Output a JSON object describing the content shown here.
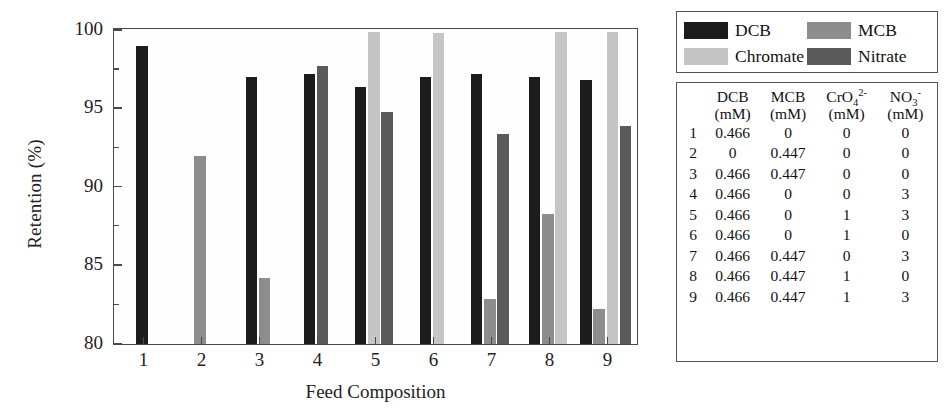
{
  "chart_data": {
    "type": "bar",
    "title": "",
    "xlabel": "Feed Composition",
    "ylabel": "Retention (%)",
    "ylim": [
      80,
      100
    ],
    "yticks": [
      80,
      85,
      90,
      95,
      100
    ],
    "yticks_minor": [
      82.5,
      87.5,
      92.5,
      97.5
    ],
    "grid": false,
    "legend_position": "outside-top-right",
    "categories": [
      "1",
      "2",
      "3",
      "4",
      "5",
      "6",
      "7",
      "8",
      "9"
    ],
    "series": [
      {
        "name": "DCB",
        "color": "#1c1c1c",
        "values": [
          99.0,
          null,
          97.0,
          97.2,
          96.4,
          97.0,
          97.2,
          97.0,
          96.8
        ]
      },
      {
        "name": "MCB",
        "color": "#8d8d8d",
        "values": [
          null,
          92.0,
          84.2,
          null,
          null,
          null,
          82.9,
          88.3,
          82.2
        ]
      },
      {
        "name": "Chromate",
        "color": "#c5c5c5",
        "values": [
          null,
          null,
          null,
          null,
          99.9,
          99.8,
          null,
          99.9,
          99.9
        ]
      },
      {
        "name": "Nitrate",
        "color": "#5a5a5a",
        "values": [
          null,
          null,
          null,
          97.7,
          94.8,
          null,
          93.4,
          null,
          93.9
        ]
      }
    ]
  },
  "legend": {
    "entries": [
      {
        "label": "DCB",
        "color": "#1c1c1c"
      },
      {
        "label": "MCB",
        "color": "#8d8d8d"
      },
      {
        "label": "Chromate",
        "color": "#c5c5c5"
      },
      {
        "label": "Nitrate",
        "color": "#5a5a5a"
      }
    ]
  },
  "table": {
    "index_header": "",
    "columns": [
      {
        "name": "DCB",
        "unit": "(mM)"
      },
      {
        "name": "MCB",
        "unit": "(mM)"
      },
      {
        "name": "CrO4",
        "charge": "2-",
        "sub": "4",
        "unit": "(mM)"
      },
      {
        "name": "NO3",
        "charge": "-",
        "sub": "3",
        "unit": "(mM)"
      }
    ],
    "rows": [
      {
        "index": "1",
        "dcb": "0.466",
        "mcb": "0",
        "chromate": "0",
        "nitrate": "0"
      },
      {
        "index": "2",
        "dcb": "0",
        "mcb": "0.447",
        "chromate": "0",
        "nitrate": "0"
      },
      {
        "index": "3",
        "dcb": "0.466",
        "mcb": "0.447",
        "chromate": "0",
        "nitrate": "0"
      },
      {
        "index": "4",
        "dcb": "0.466",
        "mcb": "0",
        "chromate": "0",
        "nitrate": "3"
      },
      {
        "index": "5",
        "dcb": "0.466",
        "mcb": "0",
        "chromate": "1",
        "nitrate": "3"
      },
      {
        "index": "6",
        "dcb": "0.466",
        "mcb": "0",
        "chromate": "1",
        "nitrate": "0"
      },
      {
        "index": "7",
        "dcb": "0.466",
        "mcb": "0.447",
        "chromate": "0",
        "nitrate": "3"
      },
      {
        "index": "8",
        "dcb": "0.466",
        "mcb": "0.447",
        "chromate": "1",
        "nitrate": "0"
      },
      {
        "index": "9",
        "dcb": "0.466",
        "mcb": "0.447",
        "chromate": "1",
        "nitrate": "3"
      }
    ]
  }
}
